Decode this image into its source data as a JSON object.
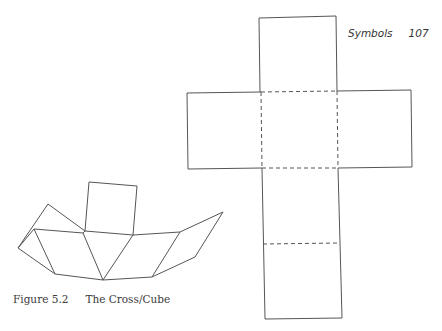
{
  "running_head": {
    "section": "Symbols",
    "page_number": "107"
  },
  "figure": {
    "label": "Figure 5.2",
    "title": "The Cross/Cube",
    "line_color": "#555555"
  },
  "diagram": {
    "cross_net": {
      "description": "Unfolded cube net in the shape of a cross; dashed lines mark fold edges",
      "faces": [
        "top",
        "left",
        "center",
        "right",
        "middle-lower",
        "bottom"
      ]
    },
    "folded_view": {
      "description": "Partially folded cube net seen in perspective"
    }
  }
}
